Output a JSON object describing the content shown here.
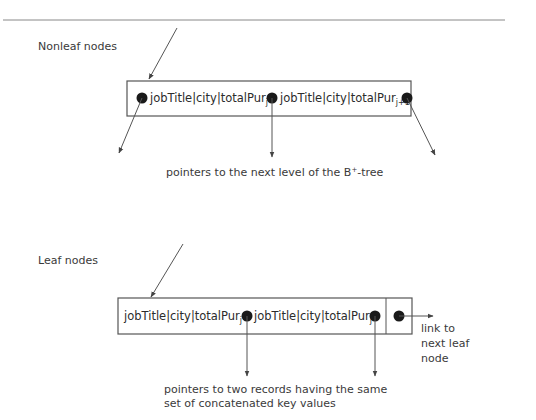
{
  "nonleaf": {
    "title": "Nonleaf nodes",
    "entries": [
      {
        "key": "jobTitle|city|totalPur",
        "sub": "j"
      },
      {
        "key": "jobTitle|city|totalPur",
        "sub": "j+1"
      }
    ],
    "caption": "pointers to the next level of the B",
    "caption_sup": "+",
    "caption_tail": "-tree"
  },
  "leaf": {
    "title": "Leaf nodes",
    "entries": [
      {
        "key": "jobTitle|city|totalPur",
        "sub": "j"
      },
      {
        "key": "jobTitle|city|totalPur",
        "sub": "j"
      }
    ],
    "link_label": [
      "link to",
      "next leaf",
      "node"
    ],
    "caption": [
      "pointers to two records having the same",
      "set of concatenated key values"
    ]
  },
  "colors": {
    "line": "#555555",
    "dot": "#1a1a1a",
    "text": "#3a3a3a"
  }
}
